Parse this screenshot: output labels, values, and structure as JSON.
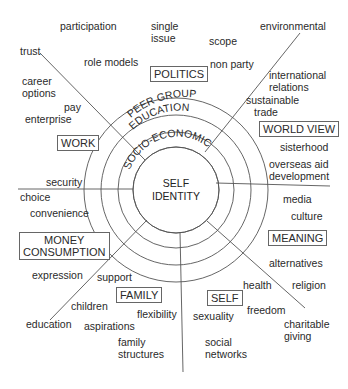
{
  "diagram": {
    "center": {
      "line1": "SELF",
      "line2": "IDENTITY"
    },
    "rings": [
      {
        "label": "SOCIO-ECONOMIC"
      },
      {
        "label": "EDUCATION"
      },
      {
        "label": "PEER GROUP"
      }
    ],
    "categories": {
      "politics": "POLITICS",
      "world_view": "WORLD VIEW",
      "work": "WORK",
      "money_consumption_1": "MONEY",
      "money_consumption_2": "CONSUMPTION",
      "meaning": "MEANING",
      "family": "FAMILY",
      "self": "SELF"
    },
    "terms": {
      "participation": "participation",
      "single_issue_1": "single",
      "single_issue_2": "issue",
      "scope": "scope",
      "environmental": "environmental",
      "trust": "trust",
      "role_models": "role models",
      "non_party": "non party",
      "career_options_1": "career",
      "career_options_2": "options",
      "international_relations_1": "international",
      "international_relations_2": "relations",
      "pay": "pay",
      "sustainable_trade_1": "sustainable",
      "sustainable_trade_2": "trade",
      "enterprise": "enterprise",
      "sisterhood": "sisterhood",
      "overseas_aid_1": "overseas aid",
      "overseas_aid_2": "development",
      "security": "security",
      "choice": "choice",
      "convenience": "convenience",
      "media": "media",
      "culture": "culture",
      "expression": "expression",
      "support": "support",
      "alternatives": "alternatives",
      "health": "health",
      "religion": "religion",
      "children": "children",
      "flexibility": "flexibility",
      "freedom": "freedom",
      "education": "education",
      "aspirations": "aspirations",
      "sexuality": "sexuality",
      "charitable_giving_1": "charitable",
      "charitable_giving_2": "giving",
      "family_structures_1": "family",
      "family_structures_2": "structures",
      "social_networks_1": "social",
      "social_networks_2": "networks"
    },
    "colors": {
      "line": "#555555",
      "text": "#2a2a2a",
      "box_border": "#666666"
    }
  }
}
